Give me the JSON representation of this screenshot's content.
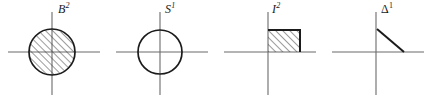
{
  "figure": {
    "background_color": "#ffffff",
    "stroke_color": "#1b1b1b",
    "axis_color": "#6b6b6b",
    "hatch_color": "#3a3a3a",
    "panel_count": 4
  },
  "panels": [
    {
      "id": "disk",
      "label_symbol": "B",
      "label_exponent": "2",
      "label_style": "italic",
      "shape": "filled-circle",
      "shape_description": "hatched closed disk centered at origin",
      "filled": true,
      "hatched": true,
      "hatch_direction": "lower-left to upper-right",
      "radius": 23,
      "center_x": 52,
      "center_y": 52
    },
    {
      "id": "circle",
      "label_symbol": "S",
      "label_exponent": "1",
      "label_style": "italic",
      "shape": "open-circle",
      "shape_description": "unfilled circle centered at origin",
      "filled": false,
      "hatched": false,
      "hatch_direction": "",
      "radius": 22,
      "center_x": 52,
      "center_y": 52
    },
    {
      "id": "square",
      "label_symbol": "I",
      "label_exponent": "2",
      "label_style": "italic",
      "shape": "filled-square",
      "shape_description": "hatched unit square in the first quadrant",
      "filled": true,
      "hatched": true,
      "hatch_direction": "lower-left to upper-right",
      "side": 32,
      "center_x": 52,
      "center_y": 52
    },
    {
      "id": "simplex",
      "label_symbol": "Δ",
      "label_exponent": "1",
      "label_style": "upright",
      "shape": "segment",
      "shape_description": "diagonal 1-simplex joining a point on the vertical axis to a point on the horizontal axis",
      "filled": false,
      "hatched": false,
      "hatch_direction": "",
      "center_x": 52,
      "center_y": 52
    }
  ]
}
